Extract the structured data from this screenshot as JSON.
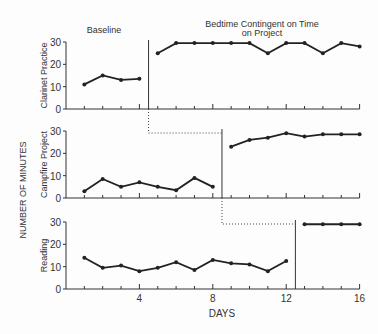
{
  "chart_data": {
    "type": "line",
    "title": "",
    "xlabel": "DAYS",
    "ylabel": "NUMBER OF MINUTES",
    "x_ticks": [
      4,
      8,
      12,
      16
    ],
    "xlim": [
      0,
      16
    ],
    "phase_labels": {
      "baseline": "Baseline",
      "treatment_line1": "Bedtime Contingent on Time",
      "treatment_line2": "on Project"
    },
    "panels": [
      {
        "name": "Clarinet Practice",
        "ylim": [
          0,
          30
        ],
        "y_ticks": [
          0,
          10,
          20,
          30
        ],
        "phase_change_after_day": 4,
        "baseline": {
          "x": [
            1,
            2,
            3,
            4
          ],
          "y": [
            11,
            15,
            13,
            13.5
          ]
        },
        "treatment": {
          "x": [
            5,
            6,
            7,
            8,
            9,
            10,
            11,
            12,
            13,
            14,
            15,
            16
          ],
          "y": [
            25,
            29.5,
            29.5,
            29.5,
            29.5,
            29.5,
            25,
            29.5,
            29.5,
            25,
            29.5,
            28
          ]
        }
      },
      {
        "name": "Campfire Project",
        "ylim": [
          0,
          30
        ],
        "y_ticks": [
          0,
          10,
          20,
          30
        ],
        "phase_change_after_day": 8,
        "baseline": {
          "x": [
            1,
            2,
            3,
            4,
            5,
            6,
            7,
            8
          ],
          "y": [
            3,
            8.5,
            5,
            7,
            5,
            3.5,
            9,
            5
          ]
        },
        "treatment": {
          "x": [
            9,
            10,
            11,
            12,
            13,
            14,
            15,
            16
          ],
          "y": [
            23,
            26,
            27,
            29,
            27.5,
            28.5,
            28.5,
            28.5
          ]
        }
      },
      {
        "name": "Reading",
        "ylim": [
          0,
          30
        ],
        "y_ticks": [
          0,
          10,
          20,
          30
        ],
        "phase_change_after_day": 12,
        "baseline": {
          "x": [
            1,
            2,
            3,
            4,
            5,
            6,
            7,
            8,
            9,
            10,
            11,
            12
          ],
          "y": [
            14,
            9.5,
            10.5,
            8,
            9.5,
            12,
            8.5,
            13,
            11.5,
            11,
            8,
            12.5
          ]
        },
        "treatment": {
          "x": [
            13,
            14,
            15,
            16
          ],
          "y": [
            29,
            29,
            29,
            29
          ]
        }
      }
    ]
  }
}
